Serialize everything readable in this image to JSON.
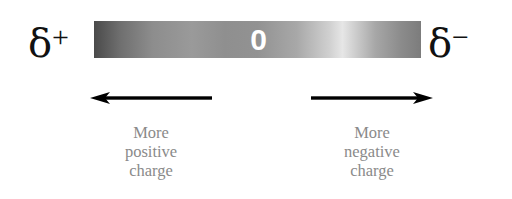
{
  "diagram": {
    "left_symbol": {
      "base": "δ",
      "sign": "+"
    },
    "right_symbol": {
      "base": "δ",
      "sign": "−"
    },
    "scale_bar": {
      "center_label": "0",
      "gradient": "dark gray → mid gray → light gray → gray",
      "colors": {
        "left_end": "#4a4a4a",
        "highlight": "#e6e6e6",
        "right_end": "#7c7c7c"
      }
    },
    "left_arrow": {
      "direction": "left",
      "caption_lines": [
        "More",
        "positive",
        "charge"
      ]
    },
    "right_arrow": {
      "direction": "right",
      "caption_lines": [
        "More",
        "negative",
        "charge"
      ]
    }
  }
}
